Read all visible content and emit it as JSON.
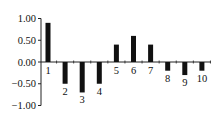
{
  "chart_data": {
    "type": "bar",
    "title": "",
    "xlabel": "",
    "ylabel": "",
    "categories": [
      "1",
      "2",
      "3",
      "4",
      "5",
      "6",
      "7",
      "8",
      "9",
      "10"
    ],
    "values": [
      0.9,
      -0.5,
      -0.7,
      -0.5,
      0.4,
      0.6,
      0.4,
      -0.2,
      -0.3,
      -0.2
    ],
    "ylim": [
      -1.0,
      1.0
    ],
    "yticks": [
      "1.00",
      "0.50",
      "0.00",
      "−0.50",
      "−1.00"
    ],
    "ytick_values": [
      1.0,
      0.5,
      0.0,
      -0.5,
      -1.0
    ],
    "grid": false,
    "legend": null,
    "bar_color": "#111111",
    "category_labels_position": "opposite side of bar below/above zero line"
  }
}
